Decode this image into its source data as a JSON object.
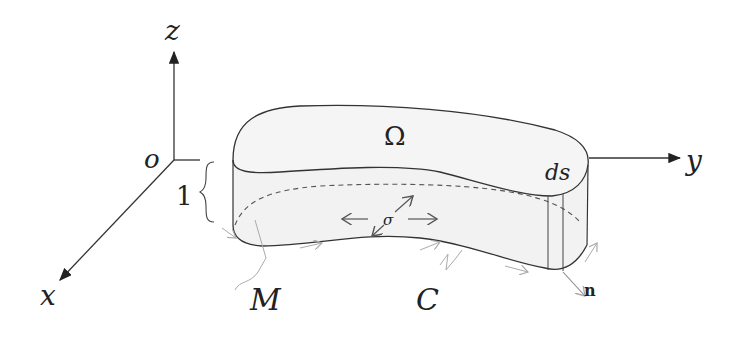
{
  "figure": {
    "type": "3d-membrane-boundary-diagram",
    "axes": {
      "origin_label": "o",
      "x_label": "x",
      "y_label": "y",
      "z_label": "z"
    },
    "body": {
      "top_surface_label": "Ω",
      "thickness_label": "1",
      "line_element_label": "ds",
      "stress_label": "σ",
      "normal_label": "n",
      "curve_label": "C",
      "moment_label": "M"
    },
    "colors": {
      "line": "#333333",
      "fill": "#f2f2f2",
      "faint": "#aaaaaa"
    }
  }
}
